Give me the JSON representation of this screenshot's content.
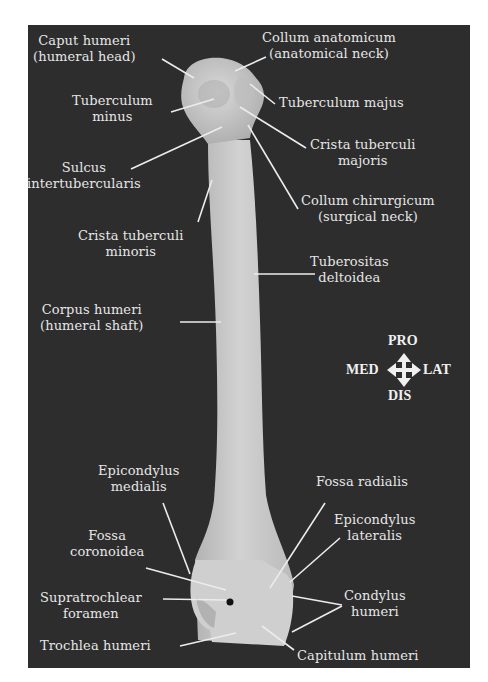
{
  "figure": {
    "panel_color": "#2d2d2d",
    "text_color": "#e6e6e6",
    "bone_color": "#c9c9c9"
  },
  "labels": {
    "caput_humeri": {
      "line1": "Caput humeri",
      "line2": "(humeral head)"
    },
    "collum_anatomicum": {
      "line1": "Collum anatomicum",
      "line2": "(anatomical neck)"
    },
    "tuberculum_minus": {
      "line1": "Tuberculum",
      "line2": "minus"
    },
    "tuberculum_majus": {
      "line1": "Tuberculum majus"
    },
    "crista_tuberculi_majoris": {
      "line1": "Crista tuberculi",
      "line2": "majoris"
    },
    "sulcus_intertubercularis": {
      "line1": "Sulcus",
      "line2": "intertubercularis"
    },
    "collum_chirurgicum": {
      "line1": "Collum chirurgicum",
      "line2": "(surgical neck)"
    },
    "crista_tuberculi_minoris": {
      "line1": "Crista tuberculi",
      "line2": "minoris"
    },
    "tuberositas_deltoidea": {
      "line1": "Tuberositas",
      "line2": "deltoidea"
    },
    "corpus_humeri": {
      "line1": "Corpus humeri",
      "line2": "(humeral shaft)"
    },
    "epicondylus_medialis": {
      "line1": "Epicondylus",
      "line2": "medialis"
    },
    "fossa_radialis": {
      "line1": "Fossa radialis"
    },
    "epicondylus_lateralis": {
      "line1": "Epicondylus",
      "line2": "lateralis"
    },
    "fossa_coronoidea": {
      "line1": "Fossa",
      "line2": "coronoidea"
    },
    "supratrochlear_foramen": {
      "line1": "Supratrochlear",
      "line2": "foramen"
    },
    "condylus_humeri": {
      "line1": "Condylus",
      "line2": "humeri"
    },
    "trochlea_humeri": {
      "line1": "Trochlea humeri"
    },
    "capitulum_humeri": {
      "line1": "Capitulum humeri"
    }
  },
  "orientation": {
    "proximal": "PRO",
    "distal": "DIS",
    "medial": "MED",
    "lateral": "LAT",
    "icon": "four-way-arrow-icon"
  }
}
